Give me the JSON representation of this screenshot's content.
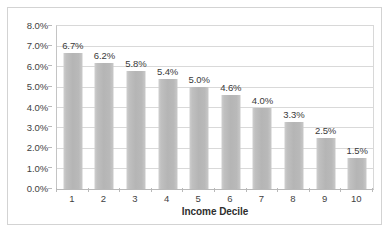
{
  "chart_data": {
    "type": "bar",
    "title": "",
    "subtitle": "",
    "xlabel": "Income Decile",
    "ylabel": "",
    "categories": [
      "1",
      "2",
      "3",
      "4",
      "5",
      "6",
      "7",
      "8",
      "9",
      "10"
    ],
    "values": [
      6.7,
      6.2,
      5.8,
      5.4,
      5.0,
      4.6,
      4.0,
      3.3,
      2.5,
      1.5
    ],
    "data_labels": [
      "6.7%",
      "6.2%",
      "5.8%",
      "5.4%",
      "5.0%",
      "4.6%",
      "4.0%",
      "3.3%",
      "2.5%",
      "1.5%"
    ],
    "ylim": [
      0,
      8
    ],
    "ytick_labels": [
      "8.0%",
      "7.0%",
      "6.0%",
      "5.0%",
      "4.0%",
      "3.0%",
      "2.0%",
      "1.0%",
      "0.0%"
    ],
    "ytick_values": [
      8,
      7,
      6,
      5,
      4,
      3,
      2,
      1,
      0
    ],
    "grid": true,
    "grid_axis": "y",
    "legend": false,
    "legend_position": "none",
    "series": [
      {
        "name": "",
        "values": [
          6.7,
          6.2,
          5.8,
          5.4,
          5.0,
          4.6,
          4.0,
          3.3,
          2.5,
          1.5
        ],
        "color": "#bdbdbd"
      }
    ]
  },
  "style": {
    "bar_color": "#bdbdbd",
    "gridline_color": "#d9d9d9",
    "axis_color": "#b9b9b9",
    "text_color": "#3f3f3f",
    "plot_background": "#ffffff",
    "frame_border_color": "#d3d3d3"
  }
}
